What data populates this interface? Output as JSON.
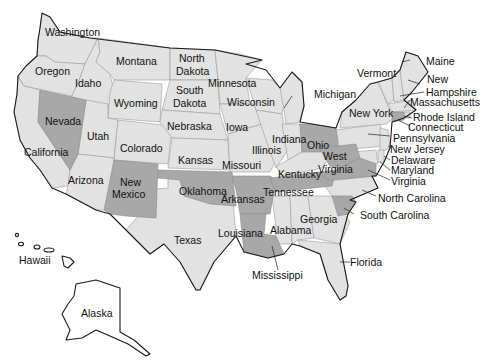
{
  "map": {
    "title": "United States",
    "colors": {
      "base": "#e2e2e2",
      "highlight": "#a8a8a8",
      "border": "#1a1a1a",
      "background": "#ffffff"
    },
    "highlighted_states": [
      "Nevada",
      "New Mexico",
      "Oklahoma",
      "Arkansas",
      "Louisiana",
      "Tennessee",
      "Ohio",
      "West Virginia",
      "Virginia",
      "South Carolina",
      "Connecticut"
    ],
    "labels": {
      "washington": "Washington",
      "oregon": "Oregon",
      "california": "California",
      "idaho": "Idaho",
      "nevada": "Nevada",
      "montana": "Montana",
      "wyoming": "Wyoming",
      "utah": "Utah",
      "arizona": "Arizona",
      "colorado": "Colorado",
      "new_mexico_1": "New",
      "new_mexico_2": "Mexico",
      "north_dakota_1": "North",
      "north_dakota_2": "Dakota",
      "south_dakota_1": "South",
      "south_dakota_2": "Dakota",
      "nebraska": "Nebraska",
      "kansas": "Kansas",
      "oklahoma": "Oklahoma",
      "texas": "Texas",
      "minnesota": "Minnesota",
      "iowa": "Iowa",
      "missouri": "Missouri",
      "arkansas": "Arkansas",
      "louisiana": "Louisiana",
      "wisconsin": "Wisconsin",
      "illinois": "Illinois",
      "michigan": "Michigan",
      "indiana": "Indiana",
      "ohio": "Ohio",
      "kentucky": "Kentucky",
      "tennessee": "Tennessee",
      "mississippi": "Mississippi",
      "alabama": "Alabama",
      "georgia": "Georgia",
      "florida": "Florida",
      "south_carolina": "South Carolina",
      "north_carolina": "North Carolina",
      "virginia": "Virginia",
      "west_virginia_1": "West",
      "west_virginia_2": "Virginia",
      "maryland": "Maryland",
      "delaware": "Delaware",
      "new_jersey": "New Jersey",
      "pennsylvania": "Pennsylvania",
      "new_york": "New York",
      "connecticut": "Connecticut",
      "rhode_island": "Rhode Island",
      "massachusetts": "Massachusetts",
      "new_hampshire_1": "New",
      "new_hampshire_2": "Hampshire",
      "vermont": "Vermont",
      "maine": "Maine",
      "hawaii": "Hawaii",
      "alaska": "Alaska"
    }
  }
}
